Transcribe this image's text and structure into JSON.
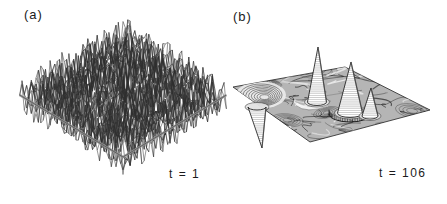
{
  "figure": {
    "background": "#ffffff",
    "ink": "#1b1b1b",
    "panel_a": {
      "label": "(a)",
      "time_label": "t = 1",
      "surface": {
        "grid": 44,
        "seed": 9,
        "amplitude": 19,
        "cx": 123,
        "cy": 95,
        "sx": 2.35,
        "sy": 1.41,
        "stroke": "#2e2e2e",
        "stroke_width": 0.5,
        "base_edge_color": "#949494"
      }
    },
    "panel_b": {
      "label": "(b)",
      "time_label": "t = 106",
      "plane": {
        "corners": [
          [
            233,
            87
          ],
          [
            345,
            67
          ],
          [
            430,
            110
          ],
          [
            310,
            142
          ]
        ],
        "fill": "#b5b5b5",
        "texture_seed": 77,
        "squiggles": 85,
        "ring_cells": 8,
        "texture_dark": "#101010",
        "texture_light": "#f5f5f5"
      },
      "crater": {
        "cx": 261,
        "cy": 95,
        "rx": 21,
        "ry": 11,
        "rings": 8
      },
      "dip": {
        "apex": [
          262,
          148
        ],
        "base": [
          257,
          107
        ],
        "rx": 9,
        "ry": 3
      },
      "apron": "M296 104 Q 306 112 327 105",
      "peaks": [
        {
          "apex": [
            318,
            47
          ],
          "base": [
            317,
            102
          ],
          "rx": 9.5,
          "ry": 3.5
        },
        {
          "apex": [
            351,
            62
          ],
          "base": [
            350,
            113
          ],
          "rx": 12.5,
          "ry": 4.5,
          "rim": {
            "rx": 21,
            "ry": 8
          }
        },
        {
          "apex": [
            371,
            88
          ],
          "base": [
            370,
            116
          ],
          "rx": 8,
          "ry": 3
        }
      ]
    }
  },
  "chart_data": {
    "type": "surface",
    "title": "",
    "layout": "two 3D perspective surface plots side by side on white background, monochrome line rendering",
    "panels": [
      {
        "label": "(a)",
        "time_label": "t = 1",
        "t": 1,
        "surface": "spatially uncorrelated random fluctuations (noise) of roughly uniform amplitude covering the entire square domain; rendered as a dense jagged wireframe mesh over a diamond-shaped base plane with a visible gray front edge",
        "features": []
      },
      {
        "label": "(b)",
        "time_label": "t = 106",
        "t": 106,
        "surface": "late-time coarsened state: a nearly flat plane with faint swirling contour texture plus five localized structures (three sharp upward peaks, one sharp downward spike, one shallow crater)",
        "features": [
          {
            "kind": "crater",
            "position_frac": [
              0.17,
              0.4
            ],
            "relative_amplitude": -0.25
          },
          {
            "kind": "spike-down",
            "position_frac": [
              0.2,
              0.6
            ],
            "relative_amplitude": -1.0
          },
          {
            "kind": "peak",
            "position_frac": [
              0.43,
              0.35
            ],
            "relative_amplitude": 1.0
          },
          {
            "kind": "peak",
            "position_frac": [
              0.58,
              0.55
            ],
            "relative_amplitude": 0.95
          },
          {
            "kind": "peak",
            "position_frac": [
              0.69,
              0.65
            ],
            "relative_amplitude": 0.5
          }
        ]
      }
    ]
  }
}
